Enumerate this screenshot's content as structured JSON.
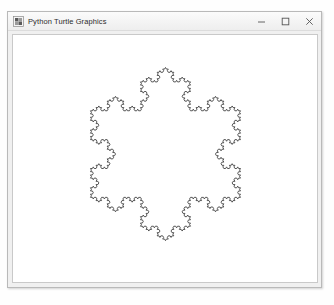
{
  "window": {
    "title": "Python Turtle Graphics",
    "app_icon": "python-turtle-icon",
    "background_color": "#f0f0f0",
    "border_color": "#b9b9b9"
  },
  "titlebar": {
    "minimize_label": "–",
    "maximize_label": "□",
    "close_label": "✕"
  },
  "canvas": {
    "background_color": "#ffffff",
    "border_color": "#c9c9c9"
  },
  "drawing": {
    "name": "koch-snowflake",
    "description": "Koch snowflake fractal",
    "order": 4,
    "sides": 3,
    "stroke_color": "#444444",
    "stroke_width": 0.9,
    "fill": "none",
    "center_x": 165,
    "center_y": 152,
    "radius": 88
  }
}
